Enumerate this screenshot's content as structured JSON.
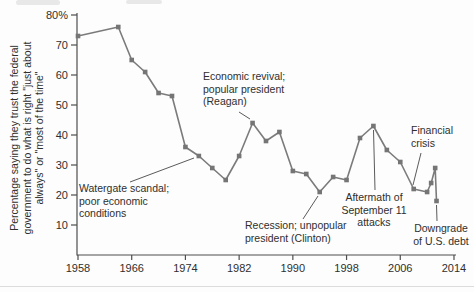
{
  "chart_data": {
    "type": "line",
    "title": "",
    "ylabel": "Percentage saying they trust the federal government to do what is right \"just about always\" or \"most of the time\"",
    "ylabel_lines": [
      "Percentage saying they trust the federal",
      "government to do what is right \"just about",
      "always\" or \"most of the time\""
    ],
    "y_top_label": "80%",
    "y_ticks": [
      70,
      60,
      50,
      40,
      30,
      20,
      10
    ],
    "x_ticks": [
      1958,
      1966,
      1974,
      1982,
      1990,
      1998,
      2006,
      2014
    ],
    "ylim": [
      0,
      80
    ],
    "xlim": [
      1958,
      2014
    ],
    "grid": false,
    "legend": "none",
    "line_color": "#7b7b7b",
    "marker": "square",
    "series": [
      {
        "points": [
          [
            1958,
            73
          ],
          [
            1964,
            76
          ],
          [
            1966,
            65
          ],
          [
            1968,
            61
          ],
          [
            1970,
            54
          ],
          [
            1972,
            53
          ],
          [
            1974,
            36
          ],
          [
            1976,
            33
          ],
          [
            1978,
            29
          ],
          [
            1980,
            25
          ],
          [
            1982,
            33
          ],
          [
            1984,
            44
          ],
          [
            1986,
            38
          ],
          [
            1988,
            41
          ],
          [
            1990,
            28
          ],
          [
            1992,
            27
          ],
          [
            1994,
            21
          ],
          [
            1996,
            26
          ],
          [
            1998,
            25
          ],
          [
            2000,
            39
          ],
          [
            2002,
            43
          ],
          [
            2004,
            35
          ],
          [
            2006,
            31
          ],
          [
            2008,
            22
          ],
          [
            2010,
            21
          ],
          [
            2010.6,
            24
          ],
          [
            2011.2,
            29
          ],
          [
            2011.4,
            18
          ]
        ]
      }
    ],
    "annotations": [
      {
        "id": "watergate",
        "lines": [
          "Watergate scandal;",
          "poor economic",
          "conditions"
        ],
        "align": "left",
        "x": 79,
        "y": 184,
        "leader": [
          130,
          182,
          194,
          158
        ]
      },
      {
        "id": "reagan",
        "lines": [
          "Economic revival;",
          "popular president",
          "(Reagan)"
        ],
        "align": "left",
        "x": 203,
        "y": 72,
        "leader": [
          239,
          112,
          250,
          119
        ]
      },
      {
        "id": "clinton",
        "lines": [
          "Recession; unpopular",
          "president (Clinton)"
        ],
        "align": "left",
        "x": 245,
        "y": 221,
        "leader": [
          303,
          219,
          318,
          196
        ]
      },
      {
        "id": "sept11",
        "lines": [
          "Aftermath of",
          "September 11",
          "attacks"
        ],
        "align": "center",
        "x": 374,
        "y": 193,
        "leader": [
          375,
          190,
          373.5,
          130
        ]
      },
      {
        "id": "financial",
        "lines": [
          "Financial",
          "crisis"
        ],
        "align": "left",
        "x": 411,
        "y": 126,
        "leader": [
          421,
          153,
          413,
          185
        ]
      },
      {
        "id": "downgrade",
        "lines": [
          "Downgrade",
          "of U.S. debt"
        ],
        "align": "center",
        "x": 441,
        "y": 224,
        "leader": [
          437,
          221,
          436.5,
          205
        ]
      }
    ]
  }
}
